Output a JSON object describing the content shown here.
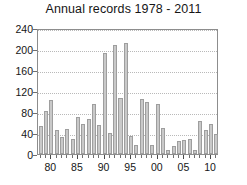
{
  "chart_data": {
    "type": "bar",
    "title": "Annual records 1978 - 2011",
    "xlabel": "",
    "ylabel": "",
    "ylim": [
      0,
      240
    ],
    "ytick_labels": [
      "0",
      "40",
      "80",
      "120",
      "160",
      "200",
      "240"
    ],
    "ytick_values": [
      0,
      40,
      80,
      120,
      160,
      200,
      240
    ],
    "xtick_labels": [
      "80",
      "85",
      "90",
      "95",
      "00",
      "05",
      "10"
    ],
    "xtick_values": [
      1980,
      1985,
      1990,
      1995,
      2000,
      2005,
      2010
    ],
    "grid": true,
    "legend": false,
    "categories": [
      "1978",
      "1979",
      "1980",
      "1981",
      "1982",
      "1983",
      "1984",
      "1985",
      "1986",
      "1987",
      "1988",
      "1989",
      "1990",
      "1991",
      "1992",
      "1993",
      "1994",
      "1995",
      "1996",
      "1997",
      "1998",
      "1999",
      "2000",
      "2001",
      "2002",
      "2003",
      "2004",
      "2005",
      "2006",
      "2007",
      "2008",
      "2009",
      "2010",
      "2011"
    ],
    "values": [
      53,
      81,
      103,
      46,
      32,
      48,
      29,
      70,
      58,
      66,
      96,
      55,
      193,
      40,
      207,
      107,
      211,
      35,
      18,
      104,
      99,
      18,
      95,
      50,
      8,
      15,
      24,
      26,
      28,
      7,
      62,
      45,
      58,
      38
    ],
    "series_name": "Annual records",
    "bar_color": "#c9c9c9",
    "bar_edge_color": "#9e9e9e",
    "grid_color": "#b9b9b9",
    "axis_color": "#8d8d8d",
    "text_color": "#161616",
    "background": "#ffffff"
  }
}
